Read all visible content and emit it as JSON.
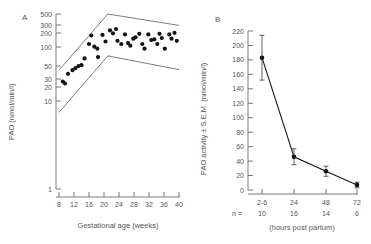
{
  "figure": {
    "panels": [
      "A",
      "B"
    ]
  },
  "panelA": {
    "label": "A",
    "ylabel": "PAO (nmol/min/l)",
    "xlabel": "Gestational age (weeks)",
    "yticks": [
      "1",
      "10",
      "20",
      "30",
      "50",
      "100",
      "200",
      "300",
      "500"
    ],
    "xticks": [
      "8",
      "12",
      "16",
      "20",
      "24",
      "28",
      "32",
      "36",
      "40"
    ]
  },
  "panelB": {
    "label": "B",
    "ylabel": "PAO activity ± S.E.M. (nmol/min/l)",
    "xlabel": "(hours post partum)",
    "nprefix": "n =",
    "yticks": [
      "0",
      "20",
      "40",
      "60",
      "80",
      "100",
      "120",
      "140",
      "160",
      "180",
      "200",
      "220"
    ],
    "xticks": [
      "2-6",
      "24",
      "48",
      "72"
    ],
    "ncounts": [
      "10",
      "16",
      "14",
      "6"
    ]
  },
  "chart_data": [
    {
      "type": "scatter",
      "title": "A",
      "xlabel": "Gestational age (weeks)",
      "ylabel": "PAO (nmol/min/l)",
      "yscale": "log",
      "xlim": [
        8,
        40
      ],
      "ylim": [
        1,
        500
      ],
      "yticks": [
        1,
        10,
        20,
        30,
        50,
        100,
        200,
        300,
        500
      ],
      "xticks": [
        8,
        12,
        16,
        20,
        24,
        28,
        32,
        36,
        40
      ],
      "grid": false,
      "legend": "none",
      "points": [
        {
          "x": 9.0,
          "y": 24
        },
        {
          "x": 9.6,
          "y": 22
        },
        {
          "x": 10.4,
          "y": 34
        },
        {
          "x": 11.6,
          "y": 40
        },
        {
          "x": 12.4,
          "y": 44
        },
        {
          "x": 13.2,
          "y": 48
        },
        {
          "x": 14.0,
          "y": 50
        },
        {
          "x": 14.8,
          "y": 68
        },
        {
          "x": 16.0,
          "y": 130
        },
        {
          "x": 16.6,
          "y": 190
        },
        {
          "x": 17.4,
          "y": 115
        },
        {
          "x": 18.2,
          "y": 105
        },
        {
          "x": 18.4,
          "y": 72
        },
        {
          "x": 19.6,
          "y": 195
        },
        {
          "x": 20.4,
          "y": 145
        },
        {
          "x": 21.6,
          "y": 240
        },
        {
          "x": 22.4,
          "y": 210
        },
        {
          "x": 23.2,
          "y": 255
        },
        {
          "x": 23.6,
          "y": 150
        },
        {
          "x": 24.6,
          "y": 130
        },
        {
          "x": 25.6,
          "y": 200
        },
        {
          "x": 26.4,
          "y": 135
        },
        {
          "x": 27.0,
          "y": 120
        },
        {
          "x": 27.8,
          "y": 165
        },
        {
          "x": 28.4,
          "y": 175
        },
        {
          "x": 29.4,
          "y": 205
        },
        {
          "x": 30.2,
          "y": 130
        },
        {
          "x": 30.8,
          "y": 105
        },
        {
          "x": 31.8,
          "y": 200
        },
        {
          "x": 32.6,
          "y": 155
        },
        {
          "x": 33.4,
          "y": 160
        },
        {
          "x": 34.2,
          "y": 130
        },
        {
          "x": 34.8,
          "y": 205
        },
        {
          "x": 35.4,
          "y": 170
        },
        {
          "x": 36.2,
          "y": 105
        },
        {
          "x": 37.4,
          "y": 200
        },
        {
          "x": 38.0,
          "y": 165
        },
        {
          "x": 38.8,
          "y": 215
        },
        {
          "x": 39.4,
          "y": 150
        }
      ],
      "upper_bound": [
        {
          "x": 8,
          "y": 40
        },
        {
          "x": 21,
          "y": 500
        },
        {
          "x": 40,
          "y": 300
        }
      ],
      "lower_bound": [
        {
          "x": 8,
          "y": 6
        },
        {
          "x": 21,
          "y": 76
        },
        {
          "x": 40,
          "y": 41
        }
      ]
    },
    {
      "type": "line",
      "title": "B",
      "xlabel": "(hours post partum)",
      "ylabel": "PAO activity ± S.E.M. (nmol/min/l)",
      "yscale": "linear",
      "ylim": [
        0,
        220
      ],
      "yticks": [
        0,
        20,
        40,
        60,
        80,
        100,
        120,
        140,
        160,
        180,
        200,
        220
      ],
      "categories": [
        "2-6",
        "24",
        "48",
        "72"
      ],
      "n": [
        10,
        16,
        14,
        6
      ],
      "grid": false,
      "legend": "none",
      "values": [
        183,
        46,
        26,
        7
      ],
      "errors": [
        31,
        11,
        7,
        4
      ]
    }
  ]
}
